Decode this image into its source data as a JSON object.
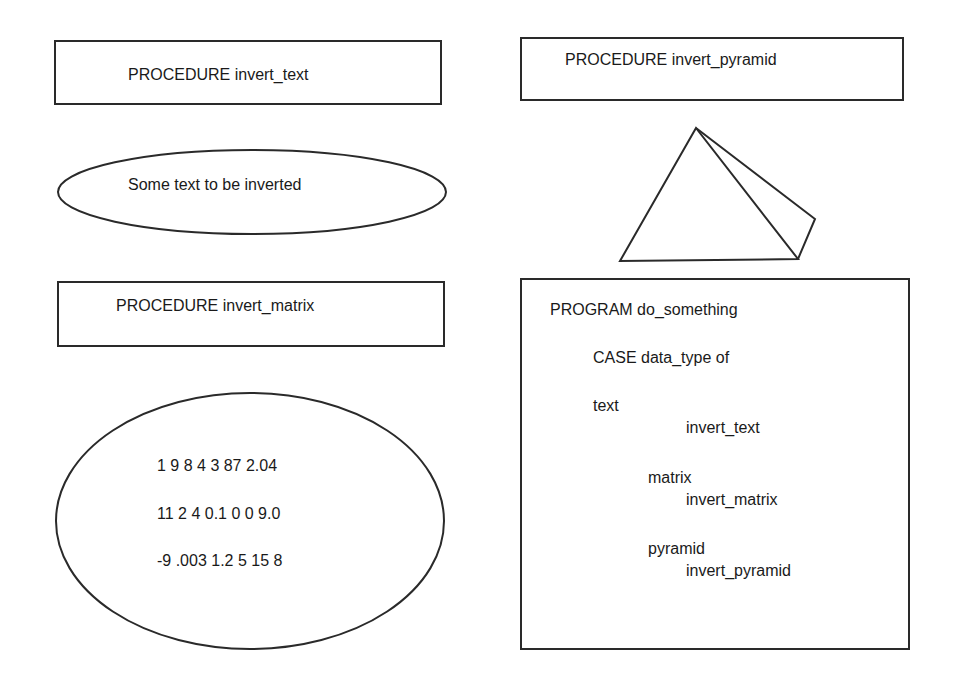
{
  "diagram": {
    "procedures": [
      {
        "label": "PROCEDURE invert_text"
      },
      {
        "label": "PROCEDURE invert_pyramid"
      },
      {
        "label": "PROCEDURE invert_matrix"
      }
    ],
    "text_data": {
      "label": "Some text to be inverted"
    },
    "matrix_data": {
      "rows": [
        "1 9 8 4 3 87 2.04",
        "11 2 4 0.1 0 0 9.0",
        "-9 .003 1.2 5 15 8"
      ]
    },
    "pyramid_data": {
      "shape": "pyramid"
    },
    "program": {
      "title": "PROGRAM do_something",
      "case_line": "CASE data_type of",
      "cases": [
        {
          "type": "text",
          "call": "invert_text"
        },
        {
          "type": "matrix",
          "call": "invert_matrix"
        },
        {
          "type": "pyramid",
          "call": "invert_pyramid"
        }
      ]
    }
  }
}
